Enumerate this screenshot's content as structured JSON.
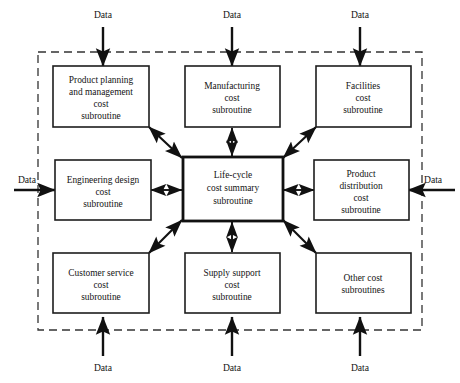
{
  "diagram": {
    "type": "block-flow-diagram",
    "background_color": "#ffffff",
    "line_color": "#111111",
    "boundary_style": "dashed",
    "boundary_color": "#333333"
  },
  "center_box": {
    "id": "life-cycle-cost-summary",
    "lines": [
      "Life-cycle",
      "cost summary",
      "subroutine"
    ],
    "emphasis": "thick-border"
  },
  "boxes": [
    {
      "id": "product-planning-and-management-cost",
      "position": "top-left",
      "lines": [
        "Product planning",
        "and management",
        "cost",
        "subroutine"
      ]
    },
    {
      "id": "manufacturing-cost",
      "position": "top-center",
      "lines": [
        "Manufacturing",
        "cost",
        "subroutine"
      ]
    },
    {
      "id": "facilities-cost",
      "position": "top-right",
      "lines": [
        "Facilities",
        "cost",
        "subroutine"
      ]
    },
    {
      "id": "engineering-design-cost",
      "position": "middle-left",
      "lines": [
        "Engineering design",
        "cost",
        "subroutine"
      ]
    },
    {
      "id": "product-distribution-cost",
      "position": "middle-right",
      "lines": [
        "Product",
        "distribution",
        "cost",
        "subroutine"
      ]
    },
    {
      "id": "customer-service-cost",
      "position": "bottom-left",
      "lines": [
        "Customer service",
        "cost",
        "subroutine"
      ]
    },
    {
      "id": "supply-support-cost",
      "position": "bottom-center",
      "lines": [
        "Supply support",
        "cost",
        "subroutine"
      ]
    },
    {
      "id": "other-cost",
      "position": "bottom-right",
      "lines": [
        "Other cost",
        "subroutines"
      ]
    }
  ],
  "data_inputs": [
    {
      "id": "data-top-left",
      "label": "Data",
      "direction": "down",
      "target": "product-planning-and-management-cost"
    },
    {
      "id": "data-top-center",
      "label": "Data",
      "direction": "down",
      "target": "manufacturing-cost"
    },
    {
      "id": "data-top-right",
      "label": "Data",
      "direction": "down",
      "target": "facilities-cost"
    },
    {
      "id": "data-left",
      "label": "Data",
      "direction": "right",
      "target": "engineering-design-cost"
    },
    {
      "id": "data-right",
      "label": "Data",
      "direction": "left",
      "target": "product-distribution-cost"
    },
    {
      "id": "data-bottom-left",
      "label": "Data",
      "direction": "up",
      "target": "customer-service-cost"
    },
    {
      "id": "data-bottom-center",
      "label": "Data",
      "direction": "up",
      "target": "supply-support-cost"
    },
    {
      "id": "data-bottom-right",
      "label": "Data",
      "direction": "up",
      "target": "other-cost"
    }
  ],
  "connections": [
    {
      "from": "product-planning-and-management-cost",
      "to": "life-cycle-cost-summary",
      "arrow": "double",
      "orientation": "diagonal"
    },
    {
      "from": "manufacturing-cost",
      "to": "life-cycle-cost-summary",
      "arrow": "double",
      "orientation": "vertical"
    },
    {
      "from": "facilities-cost",
      "to": "life-cycle-cost-summary",
      "arrow": "double",
      "orientation": "diagonal"
    },
    {
      "from": "engineering-design-cost",
      "to": "life-cycle-cost-summary",
      "arrow": "double",
      "orientation": "horizontal"
    },
    {
      "from": "product-distribution-cost",
      "to": "life-cycle-cost-summary",
      "arrow": "double",
      "orientation": "horizontal"
    },
    {
      "from": "customer-service-cost",
      "to": "life-cycle-cost-summary",
      "arrow": "double",
      "orientation": "diagonal"
    },
    {
      "from": "supply-support-cost",
      "to": "life-cycle-cost-summary",
      "arrow": "double",
      "orientation": "vertical"
    },
    {
      "from": "other-cost",
      "to": "life-cycle-cost-summary",
      "arrow": "double",
      "orientation": "diagonal"
    }
  ]
}
